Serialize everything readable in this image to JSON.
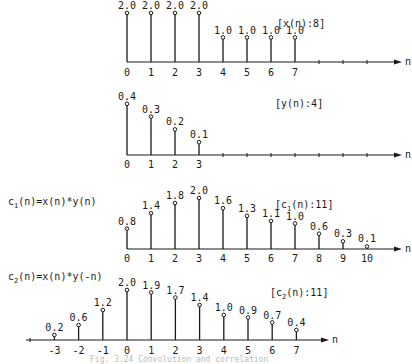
{
  "axis_label": "n",
  "plots": [
    {
      "id": "x",
      "tag": "[x(n):8]",
      "formula": "",
      "n": [
        0,
        1,
        2,
        3,
        4,
        5,
        6,
        7
      ],
      "values": [
        2.0,
        2.0,
        2.0,
        2.0,
        1.0,
        1.0,
        1.0,
        1.0
      ],
      "labels": [
        "2.0",
        "2.0",
        "2.0",
        "2.0",
        "1.0",
        "1.0",
        "1.0",
        "1.0"
      ],
      "ticks": [
        "0",
        "1",
        "2",
        "3",
        "4",
        "5",
        "6",
        "7"
      ]
    },
    {
      "id": "y",
      "tag": "[y(n):4]",
      "formula": "",
      "n": [
        0,
        1,
        2,
        3
      ],
      "values": [
        0.4,
        0.3,
        0.2,
        0.1
      ],
      "labels": [
        "0.4",
        "0.3",
        "0.2",
        "0.1"
      ],
      "ticks": [
        "0",
        "1",
        "2",
        "3"
      ]
    },
    {
      "id": "c1",
      "tag_pre": "[c",
      "tag_sub": "1",
      "tag_post": "(n):11]",
      "formula_pre": "c",
      "formula_sub": "1",
      "formula_post": "(n)=x(n)*y(n)",
      "n": [
        0,
        1,
        2,
        3,
        4,
        5,
        6,
        7,
        8,
        9,
        10
      ],
      "values": [
        0.8,
        1.4,
        1.8,
        2.0,
        1.6,
        1.3,
        1.1,
        1.0,
        0.6,
        0.3,
        0.1
      ],
      "labels": [
        "0.8",
        "1.4",
        "1.8",
        "2.0",
        "1.6",
        "1.3",
        "1.1",
        "1.0",
        "0.6",
        "0.3",
        "0.1"
      ],
      "ticks": [
        "0",
        "1",
        "2",
        "3",
        "4",
        "5",
        "6",
        "7",
        "8",
        "9",
        "10"
      ]
    },
    {
      "id": "c2",
      "tag_pre": "[c",
      "tag_sub": "2",
      "tag_post": "(n):11]",
      "formula_pre": "c",
      "formula_sub": "2",
      "formula_post": "(n)=x(n)*y(-n)",
      "n": [
        -3,
        -2,
        -1,
        0,
        1,
        2,
        3,
        4,
        5,
        6,
        7
      ],
      "values": [
        0.2,
        0.6,
        1.2,
        2.0,
        1.9,
        1.7,
        1.4,
        1.0,
        0.9,
        0.7,
        0.4
      ],
      "labels": [
        "0.2",
        "0.6",
        "1.2",
        "2.0",
        "1.9",
        "1.7",
        "1.4",
        "1.0",
        "0.9",
        "0.7",
        "0.4"
      ],
      "ticks": [
        "-3",
        "-2",
        "-1",
        "0",
        "1",
        "2",
        "3",
        "4",
        "5",
        "6",
        "7"
      ]
    }
  ],
  "caption": "Fig. 3.24   Convolution and correlation",
  "chart_data": [
    {
      "type": "stem",
      "title": "[x(n):8]",
      "xlabel": "n",
      "x": [
        0,
        1,
        2,
        3,
        4,
        5,
        6,
        7
      ],
      "values": [
        2.0,
        2.0,
        2.0,
        2.0,
        1.0,
        1.0,
        1.0,
        1.0
      ]
    },
    {
      "type": "stem",
      "title": "[y(n):4]",
      "xlabel": "n",
      "x": [
        0,
        1,
        2,
        3
      ],
      "values": [
        0.4,
        0.3,
        0.2,
        0.1
      ]
    },
    {
      "type": "stem",
      "title": "[c1(n):11]",
      "annotation": "c1(n)=x(n)*y(n)",
      "xlabel": "n",
      "x": [
        0,
        1,
        2,
        3,
        4,
        5,
        6,
        7,
        8,
        9,
        10
      ],
      "values": [
        0.8,
        1.4,
        1.8,
        2.0,
        1.6,
        1.3,
        1.1,
        1.0,
        0.6,
        0.3,
        0.1
      ]
    },
    {
      "type": "stem",
      "title": "[c2(n):11]",
      "annotation": "c2(n)=x(n)*y(-n)",
      "xlabel": "n",
      "x": [
        -3,
        -2,
        -1,
        0,
        1,
        2,
        3,
        4,
        5,
        6,
        7
      ],
      "values": [
        0.2,
        0.6,
        1.2,
        2.0,
        1.9,
        1.7,
        1.4,
        1.0,
        0.9,
        0.7,
        0.4
      ]
    }
  ]
}
